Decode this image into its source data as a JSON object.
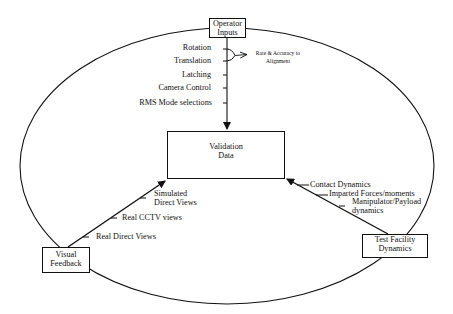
{
  "diagram": {
    "type": "cycle-flow",
    "nodes": {
      "operator_inputs": "Operator\nInputs",
      "validation_data": "Validation\nData",
      "visual_feedback": "Visual\nFeedback",
      "test_facility": "Test Facility\nDynamics"
    },
    "operator_inputs_items": [
      "Rotation",
      "Translation",
      "Latching",
      "Camera Control",
      "RMS Mode selections"
    ],
    "rate_accuracy_label": "Rate & Accuracy to\nAlignment",
    "visual_feedback_items": [
      "Simulated\nDirect Views",
      "Real CCTV views",
      "Real Direct Views"
    ],
    "test_facility_items": [
      "Contact Dynamics",
      "Imparted Forces/moments",
      "Manipulator/Payload\ndynamics"
    ],
    "edges": [
      {
        "from": "operator_inputs",
        "to": "validation_data"
      },
      {
        "from": "visual_feedback",
        "to": "validation_data"
      },
      {
        "from": "test_facility",
        "to": "validation_data"
      }
    ],
    "colors": {
      "line": "#111111",
      "background": "#ffffff"
    }
  }
}
